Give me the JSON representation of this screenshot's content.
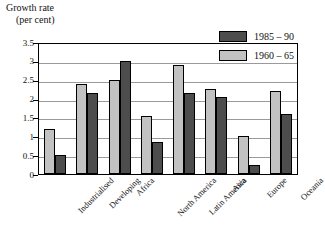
{
  "chart_data": {
    "type": "bar",
    "title": "",
    "xlabel": "",
    "ylabel": "Growth rate (per cent)",
    "ylabel_line1": "Growth rate",
    "ylabel_line2": "(per cent)",
    "ylim": [
      0,
      3.5
    ],
    "ytick_labels": [
      "0",
      "0.5",
      "1",
      "1.5",
      "2",
      "2.5",
      "3",
      "3.5"
    ],
    "ytick_values": [
      0,
      0.5,
      1,
      1.5,
      2,
      2.5,
      3,
      3.5
    ],
    "grid": true,
    "legend_position": "top-right",
    "categories": [
      "Industrialised",
      "Developing",
      "Africa",
      "North America",
      "Latin America",
      "Asia",
      "Europe",
      "Oceania"
    ],
    "series": [
      {
        "name": "1960 – 65",
        "color": "#c2c2c2",
        "values": [
          1.2,
          2.4,
          2.5,
          1.55,
          2.9,
          2.25,
          1.0,
          2.2
        ]
      },
      {
        "name": "1985 – 90",
        "color": "#4d4d4d",
        "values": [
          0.5,
          2.15,
          3.0,
          0.85,
          2.15,
          2.05,
          0.25,
          1.6
        ]
      }
    ],
    "series_draw_order": [
      "1960 – 65",
      "1985 – 90"
    ]
  },
  "legend": {
    "items": [
      {
        "label": "1985 – 90",
        "swatch": "dark-gray-swatch"
      },
      {
        "label": "1960 – 65",
        "swatch": "light-gray-swatch"
      }
    ]
  }
}
